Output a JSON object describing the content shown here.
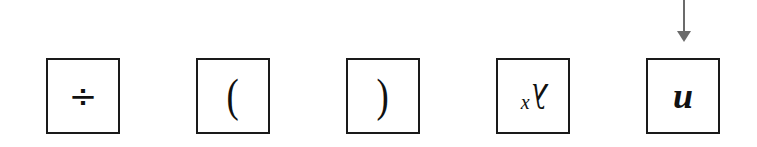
{
  "diagram": {
    "boxes": [
      {
        "id": "box-1",
        "symbol": "÷",
        "description": "division sign"
      },
      {
        "id": "box-2",
        "symbol": "(",
        "description": "left parenthesis"
      },
      {
        "id": "box-3",
        "symbol": ")",
        "description": "right parenthesis"
      },
      {
        "id": "box-4",
        "symbol": "λ",
        "subscript_left": "x",
        "description": "rotated lambda with x (upside-down x^λ style glyph)"
      },
      {
        "id": "box-5",
        "symbol": "u",
        "description": "rotated 'n' / fraktur-like u glyph",
        "selected": true
      }
    ],
    "pointer": {
      "target": "box-5",
      "color": "#6b6b6b",
      "direction": "down"
    },
    "colors": {
      "border": "#1a1a1a",
      "arrow": "#6b6b6b",
      "background": "#ffffff"
    }
  }
}
